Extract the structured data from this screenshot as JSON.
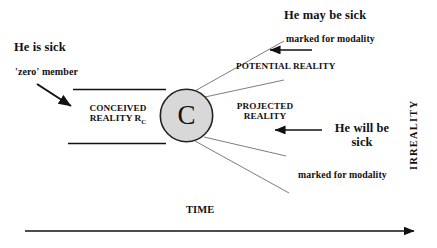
{
  "diagram": {
    "colors": {
      "line": "#111111",
      "faint_line": "#6b6b6b",
      "circle_fill": "#d8d8d8",
      "circle_stroke": "#222222",
      "text": "#111111",
      "background": "#ffffff"
    }
  },
  "labels": {
    "he_is_sick": "He is sick",
    "zero_member": "'zero' member",
    "conceived_reality_line1": "CONCEIVED",
    "conceived_reality_line2": "REALITY R",
    "conceived_reality_subscript": "C",
    "circle_letter": "C",
    "projected_reality_line1": "PROJECTED",
    "projected_reality_line2": "REALITY",
    "potential_reality": "POTENTIAL REALITY",
    "he_may_be_sick": "He may be sick",
    "marked_for_modality_top": "marked for modality",
    "marked_for_modality_bottom": "marked for modality",
    "he_will_be_sick_line1": "He will be",
    "he_will_be_sick_line2": "sick",
    "time_axis": "TIME",
    "irreality_axis": "IRREALITY"
  },
  "geometry": {
    "circle": {
      "cx": 186.5,
      "cy": 115.5,
      "r": 26.5
    },
    "conceived_top_line": {
      "x1": 73,
      "y1": 89,
      "x2": 165,
      "y2": 89
    },
    "conceived_bottom_line": {
      "x1": 68,
      "y1": 143,
      "x2": 165,
      "y2": 143
    },
    "fan_lines_upper": [
      {
        "x1": 196,
        "y1": 93,
        "x2": 283,
        "y2": 42
      },
      {
        "x1": 205,
        "y1": 99,
        "x2": 283,
        "y2": 80
      }
    ],
    "fan_lines_lower": [
      {
        "x1": 203,
        "y1": 138,
        "x2": 285,
        "y2": 155
      },
      {
        "x1": 196,
        "y1": 141,
        "x2": 288,
        "y2": 192
      }
    ],
    "zero_member_arrow": {
      "x1": 37,
      "y1": 84,
      "x2": 74,
      "y2": 108
    },
    "potential_arrow": {
      "x1": 311,
      "y1": 50,
      "x2": 268,
      "y2": 50
    },
    "projected_arrow": {
      "x1": 321,
      "y1": 130,
      "x2": 273,
      "y2": 130
    },
    "time_arrow": {
      "x1": 25,
      "y1": 231,
      "x2": 418,
      "y2": 231
    }
  }
}
